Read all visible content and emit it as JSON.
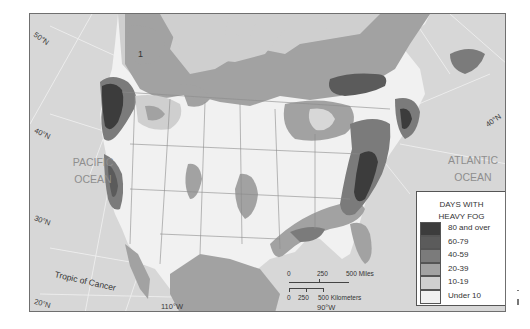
{
  "map": {
    "title": "Days with Heavy Fog - North America",
    "oceans": [
      {
        "line1": "PACIFIC",
        "line2": "OCEAN"
      },
      {
        "line1": "ATLANTIC",
        "line2": "OCEAN"
      }
    ],
    "latitudes": {
      "lat50_west": "50°N",
      "lat40_west": "40°N",
      "lat30_west": "30°N",
      "lat20_west": "20°N",
      "lat40_east": "40°N"
    },
    "longitudes": {
      "lon110": "110°W",
      "lon90": "90°W"
    },
    "tropic_label": "Tropic of Cancer",
    "region_marker": "1"
  },
  "legend": {
    "title_line1": "DAYS WITH",
    "title_line2": "HEAVY FOG",
    "items": [
      {
        "label": "80 and over",
        "color": "#3c3c3c"
      },
      {
        "label": "60-79",
        "color": "#5b5b5b"
      },
      {
        "label": "40-59",
        "color": "#7b7b7b"
      },
      {
        "label": "20-39",
        "color": "#a2a2a2"
      },
      {
        "label": "10-19",
        "color": "#cfcfcf"
      },
      {
        "label": "Under 10",
        "color": "#f1f1f1"
      }
    ]
  },
  "scale_bar": {
    "miles": {
      "zero": "0",
      "mid": "250",
      "end": "500 Miles"
    },
    "kilometers": {
      "zero": "0",
      "mid": "250",
      "end": "500 Kilometers"
    }
  },
  "colors": {
    "ocean": "#d7d7d7",
    "land_light": "#f1f1f1",
    "border": "#6f6f6f"
  }
}
